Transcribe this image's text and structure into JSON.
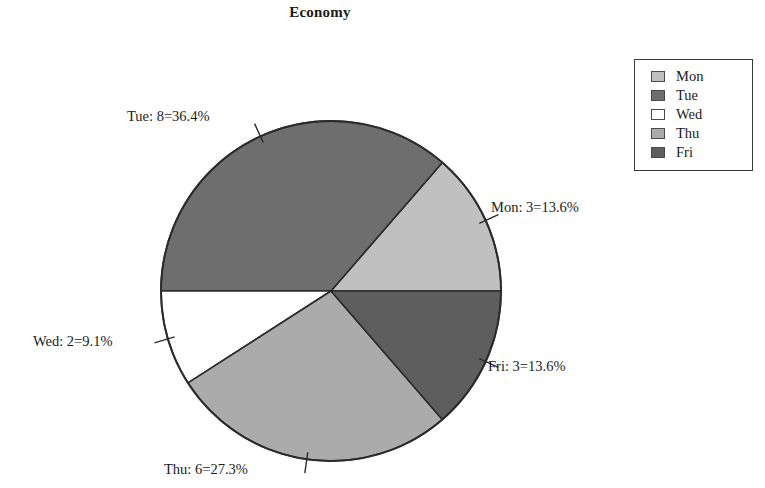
{
  "chart_data": {
    "type": "pie",
    "title": "Economy",
    "xlabel": "",
    "ylabel": "",
    "total": 22,
    "legend_position": "top-right",
    "grid": false,
    "categories": [
      "Mon",
      "Tue",
      "Wed",
      "Thu",
      "Fri"
    ],
    "values": [
      3,
      8,
      2,
      6,
      3
    ],
    "percents": [
      13.6,
      36.4,
      9.1,
      27.3,
      13.6
    ],
    "colors": [
      "#c0c0c0",
      "#6e6e6e",
      "#ffffff",
      "#ababab",
      "#5e5e5e"
    ],
    "slice_labels": [
      "Mon: 3=13.6%",
      "Tue: 8=36.4%",
      "Wed: 2=9.1%",
      "Thu: 6=27.3%",
      "Fri: 3=13.6%"
    ],
    "slices": [
      {
        "name": "Mon",
        "value": 3,
        "percent": 13.6,
        "label": "Mon: 3=13.6%",
        "color": "#c0c0c0"
      },
      {
        "name": "Tue",
        "value": 8,
        "percent": 36.4,
        "label": "Tue: 8=36.4%",
        "color": "#6e6e6e"
      },
      {
        "name": "Wed",
        "value": 2,
        "percent": 9.1,
        "label": "Wed: 2=9.1%",
        "color": "#ffffff"
      },
      {
        "name": "Thu",
        "value": 6,
        "percent": 27.3,
        "label": "Thu: 6=27.3%",
        "color": "#ababab"
      },
      {
        "name": "Fri",
        "value": 3,
        "percent": 13.6,
        "label": "Fri: 3=13.6%",
        "color": "#5e5e5e"
      }
    ]
  },
  "title": {
    "text": "Economy"
  },
  "legend": {
    "items": [
      {
        "label": "Mon",
        "color": "#c0c0c0"
      },
      {
        "label": "Tue",
        "color": "#6e6e6e"
      },
      {
        "label": "Wed",
        "color": "#ffffff"
      },
      {
        "label": "Thu",
        "color": "#ababab"
      },
      {
        "label": "Fri",
        "color": "#5e5e5e"
      }
    ]
  },
  "labels": {
    "mon": "Mon: 3=13.6%",
    "tue": "Tue: 8=36.4%",
    "wed": "Wed: 2=9.1%",
    "thu": "Thu: 6=27.3%",
    "fri": "Fri: 3=13.6%"
  }
}
